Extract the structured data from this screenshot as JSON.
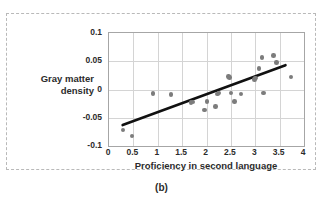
{
  "caption": "(b)",
  "chart_data": {
    "type": "scatter",
    "title": "",
    "xlabel": "Proficiency in second language",
    "ylabel": "Gray matter density",
    "ylabel_lines": [
      "Gray matter",
      "density"
    ],
    "xlim": [
      0,
      4
    ],
    "ylim": [
      -0.1,
      0.1
    ],
    "xticks": [
      0,
      0.5,
      1,
      1.5,
      2,
      2.5,
      3,
      3.5,
      4
    ],
    "xtick_labels": [
      "0",
      "0.5",
      "1",
      "1.5",
      "2",
      "2.5",
      "3",
      "3.5",
      "4"
    ],
    "yticks": [
      -0.1,
      -0.05,
      0,
      0.05,
      0.1
    ],
    "ytick_labels": [
      "-0.1",
      "-0.05",
      "0",
      "0.05",
      "0.1"
    ],
    "grid": true,
    "legend": null,
    "point_color": "#7c7c7c",
    "line_color": "#111111",
    "points": [
      {
        "x": 0.29,
        "y": -0.072
      },
      {
        "x": 0.47,
        "y": -0.082
      },
      {
        "x": 0.9,
        "y": -0.007
      },
      {
        "x": 1.27,
        "y": -0.009
      },
      {
        "x": 1.68,
        "y": -0.023
      },
      {
        "x": 1.72,
        "y": -0.022
      },
      {
        "x": 1.96,
        "y": -0.036
      },
      {
        "x": 2.01,
        "y": -0.021
      },
      {
        "x": 2.18,
        "y": -0.03
      },
      {
        "x": 2.23,
        "y": -0.008
      },
      {
        "x": 2.26,
        "y": -0.006
      },
      {
        "x": 2.45,
        "y": 0.023
      },
      {
        "x": 2.47,
        "y": 0.021
      },
      {
        "x": 2.5,
        "y": -0.006
      },
      {
        "x": 2.57,
        "y": -0.021
      },
      {
        "x": 2.71,
        "y": -0.008
      },
      {
        "x": 2.98,
        "y": 0.018
      },
      {
        "x": 3.01,
        "y": 0.02
      },
      {
        "x": 3.08,
        "y": 0.037
      },
      {
        "x": 3.14,
        "y": 0.057
      },
      {
        "x": 3.17,
        "y": -0.006
      },
      {
        "x": 3.38,
        "y": 0.06
      },
      {
        "x": 3.44,
        "y": 0.048
      },
      {
        "x": 3.73,
        "y": 0.022
      }
    ],
    "trendline": {
      "x0": 0.28,
      "y0": -0.063,
      "x1": 3.62,
      "y1": 0.043
    }
  }
}
